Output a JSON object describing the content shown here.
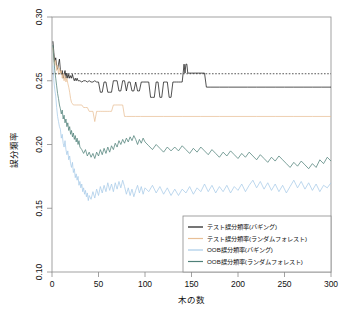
{
  "chart_data": {
    "type": "line",
    "title": "",
    "subtitle": "",
    "xlabel": "木の数",
    "ylabel": "誤分類率",
    "xlim": [
      0,
      300
    ],
    "ylim": [
      0.1,
      0.3
    ],
    "grid": false,
    "xticks": [
      0,
      50,
      100,
      150,
      200,
      250,
      300
    ],
    "xticklabels": [
      "0",
      "50",
      "100",
      "150",
      "200",
      "250",
      "300"
    ],
    "yticks": [
      0.1,
      0.15,
      0.2,
      0.25,
      0.3
    ],
    "yticklabels": [
      "0.10",
      "0.15",
      "0.20",
      "0.25",
      "0.30"
    ],
    "legend_position": "bottom-right",
    "annotations": [
      {
        "name": "reference-line",
        "type": "hline",
        "y": 0.2555,
        "style": "dashed",
        "color": "#111111"
      }
    ],
    "series": [
      {
        "name": "テスト誤分類率(バギング)",
        "color": "#1a1a1a",
        "x": [
          1,
          2,
          3,
          4,
          5,
          6,
          7,
          8,
          9,
          10,
          11,
          12,
          13,
          14,
          15,
          16,
          17,
          18,
          19,
          20,
          21,
          22,
          23,
          24,
          25,
          26,
          27,
          28,
          30,
          32,
          34,
          36,
          38,
          40,
          42,
          44,
          46,
          48,
          50,
          52,
          54,
          56,
          58,
          60,
          62,
          64,
          66,
          68,
          70,
          72,
          74,
          76,
          78,
          80,
          82,
          84,
          86,
          88,
          90,
          92,
          94,
          96,
          98,
          100,
          102,
          104,
          106,
          108,
          110,
          112,
          114,
          116,
          118,
          120,
          122,
          124,
          126,
          128,
          130,
          132,
          134,
          136,
          138,
          140,
          141,
          142,
          143,
          144,
          145,
          146,
          148,
          150,
          152,
          154,
          156,
          158,
          160,
          162,
          164,
          166,
          170,
          180,
          190,
          200,
          210,
          220,
          230,
          240,
          250,
          260,
          270,
          280,
          290,
          300
        ],
        "y": [
          0.281,
          0.272,
          0.265,
          0.268,
          0.262,
          0.259,
          0.263,
          0.267,
          0.259,
          0.255,
          0.258,
          0.252,
          0.255,
          0.258,
          0.252,
          0.256,
          0.252,
          0.255,
          0.252,
          0.254,
          0.252,
          0.255,
          0.252,
          0.25,
          0.252,
          0.25,
          0.252,
          0.25,
          0.25,
          0.249,
          0.25,
          0.25,
          0.249,
          0.25,
          0.249,
          0.249,
          0.25,
          0.249,
          0.249,
          0.241,
          0.241,
          0.249,
          0.249,
          0.241,
          0.241,
          0.241,
          0.25,
          0.25,
          0.25,
          0.242,
          0.242,
          0.25,
          0.25,
          0.242,
          0.249,
          0.249,
          0.242,
          0.242,
          0.249,
          0.242,
          0.242,
          0.249,
          0.249,
          0.249,
          0.249,
          0.249,
          0.237,
          0.237,
          0.237,
          0.249,
          0.249,
          0.237,
          0.237,
          0.249,
          0.249,
          0.249,
          0.237,
          0.237,
          0.249,
          0.249,
          0.249,
          0.249,
          0.249,
          0.249,
          0.256,
          0.263,
          0.256,
          0.263,
          0.263,
          0.256,
          0.256,
          0.256,
          0.256,
          0.256,
          0.256,
          0.256,
          0.256,
          0.256,
          0.256,
          0.245,
          0.245,
          0.245,
          0.245,
          0.245,
          0.245,
          0.245,
          0.245,
          0.245,
          0.245,
          0.245,
          0.245,
          0.245,
          0.245,
          0.245
        ]
      },
      {
        "name": "テスト誤分類率(ランダムフォレスト)",
        "color": "#e8bf96",
        "x": [
          1,
          2,
          3,
          4,
          5,
          6,
          7,
          8,
          9,
          10,
          11,
          12,
          13,
          14,
          15,
          16,
          17,
          18,
          19,
          20,
          21,
          22,
          23,
          24,
          25,
          26,
          28,
          30,
          32,
          34,
          36,
          38,
          40,
          42,
          44,
          46,
          48,
          50,
          52,
          54,
          56,
          58,
          60,
          62,
          64,
          66,
          68,
          70,
          72,
          74,
          76,
          78,
          80,
          85,
          90,
          95,
          100,
          120,
          140,
          160,
          180,
          200,
          220,
          240,
          260,
          280,
          300
        ],
        "y": [
          0.276,
          0.268,
          0.262,
          0.266,
          0.258,
          0.262,
          0.255,
          0.26,
          0.256,
          0.258,
          0.252,
          0.256,
          0.25,
          0.254,
          0.249,
          0.252,
          0.248,
          0.245,
          0.241,
          0.236,
          0.233,
          0.232,
          0.231,
          0.231,
          0.231,
          0.231,
          0.231,
          0.231,
          0.231,
          0.229,
          0.229,
          0.229,
          0.226,
          0.226,
          0.226,
          0.218,
          0.226,
          0.226,
          0.226,
          0.226,
          0.226,
          0.226,
          0.226,
          0.226,
          0.226,
          0.231,
          0.231,
          0.231,
          0.231,
          0.231,
          0.231,
          0.222,
          0.222,
          0.222,
          0.222,
          0.222,
          0.222,
          0.222,
          0.222,
          0.222,
          0.222,
          0.222,
          0.222,
          0.222,
          0.222,
          0.222,
          0.222
        ]
      },
      {
        "name": "OOB誤分類率(バギング)",
        "color": "#a8cbe8",
        "x": [
          1,
          2,
          3,
          4,
          5,
          6,
          7,
          8,
          9,
          10,
          11,
          12,
          13,
          14,
          15,
          16,
          17,
          18,
          19,
          20,
          21,
          22,
          23,
          24,
          25,
          26,
          27,
          28,
          29,
          30,
          31,
          32,
          33,
          34,
          35,
          36,
          37,
          38,
          39,
          40,
          42,
          44,
          46,
          48,
          50,
          52,
          54,
          56,
          58,
          60,
          62,
          64,
          66,
          68,
          70,
          72,
          74,
          76,
          78,
          80,
          82,
          84,
          86,
          88,
          90,
          92,
          94,
          96,
          98,
          100,
          104,
          108,
          112,
          116,
          120,
          124,
          128,
          132,
          136,
          140,
          144,
          148,
          152,
          156,
          160,
          164,
          168,
          172,
          176,
          180,
          184,
          188,
          192,
          196,
          200,
          204,
          208,
          212,
          216,
          220,
          224,
          228,
          232,
          236,
          240,
          244,
          248,
          252,
          256,
          260,
          264,
          268,
          272,
          276,
          280,
          284,
          288,
          292,
          296,
          300
        ],
        "y": [
          0.262,
          0.25,
          0.243,
          0.238,
          0.229,
          0.222,
          0.218,
          0.214,
          0.212,
          0.205,
          0.208,
          0.201,
          0.198,
          0.203,
          0.196,
          0.192,
          0.195,
          0.188,
          0.191,
          0.185,
          0.182,
          0.186,
          0.178,
          0.181,
          0.174,
          0.177,
          0.172,
          0.175,
          0.168,
          0.171,
          0.166,
          0.169,
          0.163,
          0.166,
          0.161,
          0.164,
          0.159,
          0.162,
          0.156,
          0.16,
          0.157,
          0.163,
          0.158,
          0.165,
          0.16,
          0.167,
          0.162,
          0.168,
          0.163,
          0.17,
          0.164,
          0.169,
          0.163,
          0.17,
          0.165,
          0.171,
          0.166,
          0.172,
          0.167,
          0.161,
          0.166,
          0.16,
          0.165,
          0.159,
          0.164,
          0.168,
          0.162,
          0.167,
          0.161,
          0.166,
          0.163,
          0.168,
          0.162,
          0.167,
          0.161,
          0.166,
          0.16,
          0.165,
          0.16,
          0.165,
          0.162,
          0.167,
          0.161,
          0.166,
          0.163,
          0.169,
          0.163,
          0.168,
          0.162,
          0.167,
          0.163,
          0.168,
          0.162,
          0.167,
          0.164,
          0.169,
          0.163,
          0.168,
          0.172,
          0.166,
          0.171,
          0.165,
          0.17,
          0.164,
          0.169,
          0.163,
          0.168,
          0.162,
          0.167,
          0.172,
          0.166,
          0.171,
          0.165,
          0.17,
          0.164,
          0.169,
          0.163,
          0.168,
          0.166,
          0.17
        ]
      },
      {
        "name": "OOB誤分類率(ランダムフォレスト)",
        "color": "#4f8078",
        "x": [
          1,
          2,
          3,
          4,
          5,
          6,
          7,
          8,
          9,
          10,
          11,
          12,
          13,
          14,
          15,
          16,
          17,
          18,
          19,
          20,
          21,
          22,
          23,
          24,
          25,
          26,
          27,
          28,
          29,
          30,
          32,
          34,
          36,
          38,
          40,
          42,
          44,
          46,
          48,
          50,
          52,
          54,
          56,
          58,
          60,
          62,
          64,
          66,
          68,
          70,
          72,
          74,
          76,
          78,
          80,
          82,
          84,
          86,
          88,
          90,
          92,
          94,
          96,
          98,
          100,
          104,
          108,
          112,
          116,
          120,
          124,
          128,
          132,
          136,
          140,
          144,
          148,
          152,
          156,
          160,
          164,
          168,
          172,
          176,
          180,
          184,
          188,
          192,
          196,
          200,
          204,
          208,
          212,
          216,
          220,
          224,
          228,
          232,
          236,
          240,
          244,
          248,
          252,
          256,
          260,
          264,
          268,
          272,
          276,
          280,
          284,
          288,
          292,
          296,
          300
        ],
        "y": [
          0.278,
          0.266,
          0.258,
          0.252,
          0.246,
          0.24,
          0.236,
          0.231,
          0.228,
          0.224,
          0.227,
          0.22,
          0.223,
          0.217,
          0.22,
          0.214,
          0.217,
          0.211,
          0.214,
          0.208,
          0.211,
          0.206,
          0.209,
          0.204,
          0.207,
          0.202,
          0.205,
          0.2,
          0.203,
          0.198,
          0.196,
          0.193,
          0.196,
          0.191,
          0.194,
          0.19,
          0.193,
          0.189,
          0.194,
          0.191,
          0.196,
          0.192,
          0.197,
          0.193,
          0.198,
          0.194,
          0.199,
          0.196,
          0.201,
          0.198,
          0.203,
          0.2,
          0.204,
          0.201,
          0.205,
          0.202,
          0.206,
          0.203,
          0.207,
          0.204,
          0.2,
          0.204,
          0.201,
          0.205,
          0.202,
          0.199,
          0.196,
          0.2,
          0.197,
          0.194,
          0.198,
          0.195,
          0.198,
          0.195,
          0.199,
          0.196,
          0.193,
          0.197,
          0.194,
          0.198,
          0.195,
          0.192,
          0.196,
          0.193,
          0.19,
          0.194,
          0.191,
          0.195,
          0.192,
          0.189,
          0.193,
          0.19,
          0.194,
          0.191,
          0.188,
          0.192,
          0.189,
          0.186,
          0.19,
          0.187,
          0.191,
          0.188,
          0.185,
          0.182,
          0.186,
          0.183,
          0.187,
          0.184,
          0.181,
          0.185,
          0.182,
          0.188,
          0.185,
          0.19,
          0.187
        ]
      }
    ]
  },
  "legend": {
    "items": [
      {
        "label": "テスト誤分類率(バギング)",
        "color": "#1a1a1a"
      },
      {
        "label": "テスト誤分類率(ランダムフォレスト)",
        "color": "#e8bf96"
      },
      {
        "label": "OOB誤分類率(バギング)",
        "color": "#a8cbe8"
      },
      {
        "label": "OOB誤分類率(ランダムフォレスト)",
        "color": "#4f8078"
      }
    ]
  },
  "axes": {
    "x_label": "木の数",
    "y_label": "誤分類率",
    "x_tick_labels": [
      "0",
      "50",
      "100",
      "150",
      "200",
      "250",
      "300"
    ],
    "y_tick_labels": [
      "0.10",
      "0.15",
      "0.20",
      "0.25",
      "0.30"
    ]
  },
  "colors": {
    "test_bagging": "#1a1a1a",
    "test_random_forest": "#e8bf96",
    "oob_bagging": "#a8cbe8",
    "oob_random_forest": "#4f8078",
    "frame": "#8a8a8a",
    "background": "#ffffff"
  }
}
